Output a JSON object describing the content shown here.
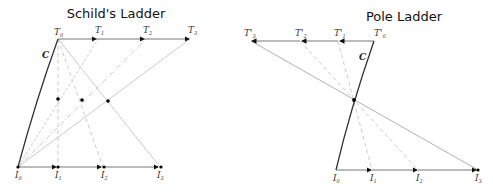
{
  "schild": {
    "title": "Schild's Ladder",
    "curve_label": "C",
    "top_labels": [
      {
        "base": "T",
        "sub": "0"
      },
      {
        "base": "T",
        "sub": "1"
      },
      {
        "base": "T",
        "sub": "2"
      },
      {
        "base": "T",
        "sub": "3"
      }
    ],
    "bottom_labels": [
      {
        "base": "I",
        "sub": "0"
      },
      {
        "base": "I",
        "sub": "1"
      },
      {
        "base": "I",
        "sub": "2"
      },
      {
        "base": "I",
        "sub": "3"
      }
    ]
  },
  "pole": {
    "title": "Pole Ladder",
    "curve_label": "C",
    "top_labels": [
      {
        "base": "T'",
        "sub": "0"
      },
      {
        "base": "T'",
        "sub": "1"
      },
      {
        "base": "T'",
        "sub": "2"
      },
      {
        "base": "T'",
        "sub": "3"
      }
    ],
    "bottom_labels": [
      {
        "base": "I",
        "sub": "0"
      },
      {
        "base": "I",
        "sub": "1"
      },
      {
        "base": "I",
        "sub": "2"
      },
      {
        "base": "I",
        "sub": "3"
      }
    ]
  },
  "colors": {
    "curve": "#333333",
    "vector": "#555555",
    "construction": "#bbbbbb",
    "point": "#000000"
  }
}
